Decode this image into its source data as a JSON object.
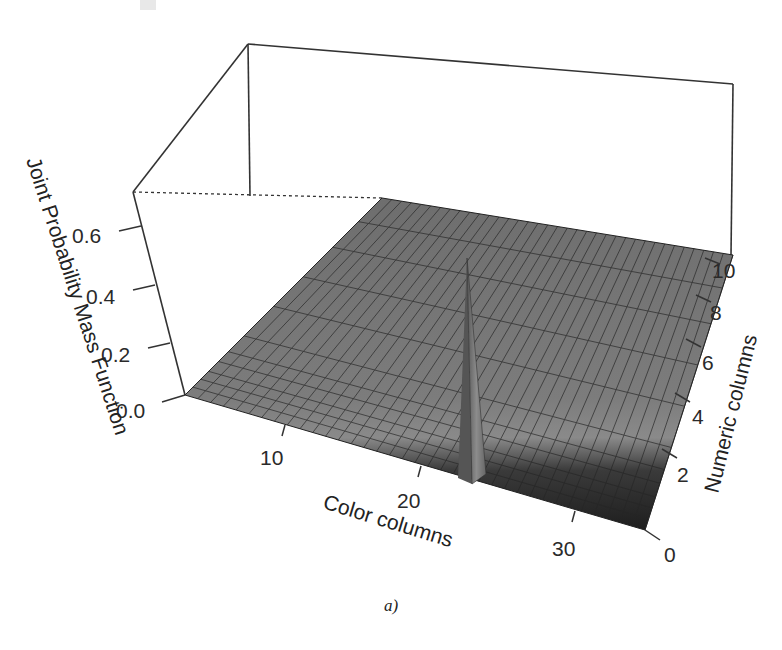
{
  "chart_data": {
    "type": "surface3d",
    "title": "",
    "caption": "a)",
    "zlabel": "Joint Probability Mass Function",
    "xlabel": "Color columns",
    "ylabel": "Numeric columns",
    "z_ticks": [
      "0.0",
      "0.2",
      "0.4",
      "0.6"
    ],
    "x_ticks": [
      "10",
      "20",
      "30"
    ],
    "y_ticks": [
      "0",
      "2",
      "4",
      "6",
      "8",
      "10"
    ],
    "zlim": [
      0,
      0.7
    ],
    "xlim": [
      0,
      36
    ],
    "ylim": [
      0,
      10
    ],
    "surface_description": "Near-flat surface close to 0 everywhere, with a single sharp spike",
    "peak": {
      "x": 20,
      "y": 0,
      "z": 0.6
    },
    "baseline_z": 0.0,
    "grid": false
  },
  "labels": {
    "z_axis_title": "Joint Probability Mass Function",
    "x_axis_title": "Color columns",
    "y_axis_title": "Numeric columns",
    "caption": "a)"
  }
}
